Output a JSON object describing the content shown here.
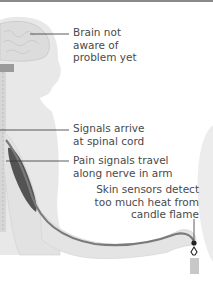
{
  "diagram": {
    "labels": {
      "brain": "Brain not\naware of\nproblem yet",
      "spinal": "Signals arrive\nat spinal cord",
      "nerve": "Pain signals travel\nalong nerve in arm",
      "skin": "Skin sensors detect\ntoo much heat from\ncandle flame"
    },
    "colors": {
      "body": "#e6e6e6",
      "body_edge": "#d4d4d4",
      "nerve": "#7a7a7a",
      "muscle": "#3a3a3a",
      "leader": "#333333",
      "text": "#4a4a4a",
      "candle": "#c8c8c8"
    }
  }
}
